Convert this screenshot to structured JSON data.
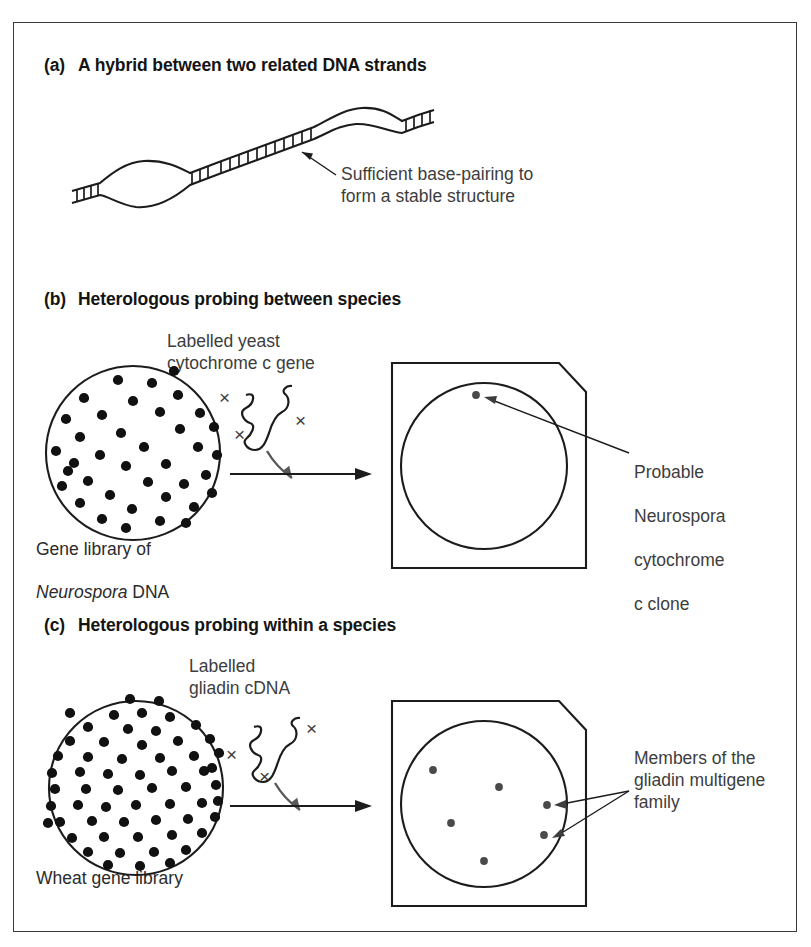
{
  "figure": {
    "panels": [
      {
        "id": "a",
        "tag": "(a)",
        "title": "A hybrid between two related DNA strands",
        "annotation": "Sufficient base-pairing to\nform a stable structure"
      },
      {
        "id": "b",
        "tag": "(b)",
        "title": "Heterologous probing between species",
        "probe_label": "Labelled yeast\ncytochrome c gene",
        "library_caption_line1": "Gene library of",
        "library_caption_line2": "Neurospora DNA",
        "library_caption_italic_word": "Neurospora",
        "result_label_line1": "Probable",
        "result_label_line2": "Neurospora",
        "result_label_line3": "cytochrome",
        "result_label_line4": "c clone",
        "colony_count": 38,
        "signal_count": 1
      },
      {
        "id": "c",
        "tag": "(c)",
        "title": "Heterologous probing within a species",
        "probe_label": "Labelled\ngliadin cDNA",
        "library_caption_line1": "Wheat gene library",
        "result_label": "Members of the\ngliadin multigene\nfamily",
        "colony_count": 60,
        "signal_count": 6
      }
    ],
    "probe_marks": {
      "label_symbol": "×",
      "marks_per_probe": 3
    },
    "colors": {
      "ink": "#1c1c1c",
      "text": "#2b2b2b",
      "annotation_text": "#3d3d3d",
      "frame": "#3a3a3a",
      "colony_fill": "#111111",
      "signal_fill": "#4a4a4a",
      "probe_arrow": "#585858",
      "background": "#ffffff"
    }
  }
}
